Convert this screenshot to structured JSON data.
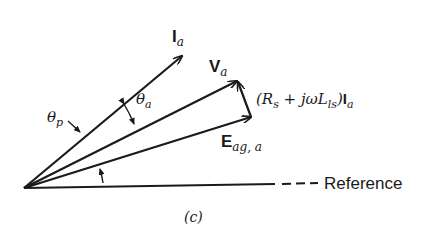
{
  "diagram": {
    "caption": "(c)",
    "reference_label": "Reference",
    "colors": {
      "stroke": "#1a1a1a",
      "background": "#ffffff"
    },
    "phasors": {
      "ia": {
        "symbol": "I",
        "subscript": "a"
      },
      "va": {
        "symbol": "V",
        "subscript": "a"
      },
      "eag": {
        "symbol": "E",
        "subscript": "ag, a"
      }
    },
    "drop_label": {
      "prefix": "(R",
      "rs_sub": "s",
      "middle": " + jωL",
      "lls_sub": "ls",
      "close": ")",
      "current_symbol": "I",
      "current_sub": "a"
    },
    "angles": {
      "theta_p": {
        "symbol": "θ",
        "subscript": "p"
      },
      "theta_a": {
        "symbol": "θ",
        "subscript": "a"
      }
    }
  }
}
